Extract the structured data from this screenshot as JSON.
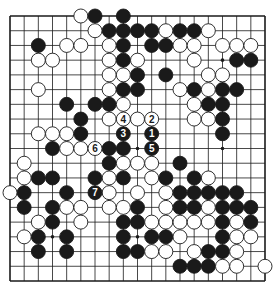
{
  "diagram": {
    "type": "go-board",
    "size": 19,
    "colors": {
      "background": "#ffffff",
      "line": "#1a1a1a",
      "black": "#1a1a1a",
      "white": "#ffffff"
    },
    "star_points": [
      [
        3,
        3
      ],
      [
        3,
        9
      ],
      [
        3,
        15
      ],
      [
        9,
        3
      ],
      [
        9,
        9
      ],
      [
        9,
        15
      ],
      [
        15,
        3
      ],
      [
        15,
        9
      ],
      [
        15,
        15
      ]
    ],
    "black_stones": [
      [
        0,
        6
      ],
      [
        0,
        8
      ],
      [
        1,
        7
      ],
      [
        1,
        8
      ],
      [
        1,
        9
      ],
      [
        1,
        10
      ],
      [
        1,
        12
      ],
      [
        1,
        13
      ],
      [
        2,
        2
      ],
      [
        2,
        8
      ],
      [
        2,
        10
      ],
      [
        2,
        11
      ],
      [
        3,
        8
      ],
      [
        3,
        16
      ],
      [
        3,
        17
      ],
      [
        4,
        9
      ],
      [
        4,
        11
      ],
      [
        5,
        8
      ],
      [
        5,
        9
      ],
      [
        5,
        13
      ],
      [
        5,
        15
      ],
      [
        5,
        16
      ],
      [
        6,
        4
      ],
      [
        6,
        6
      ],
      [
        6,
        7
      ],
      [
        6,
        14
      ],
      [
        6,
        15
      ],
      [
        7,
        5
      ],
      [
        7,
        15
      ],
      [
        8,
        5
      ],
      [
        8,
        15
      ],
      [
        9,
        3
      ],
      [
        9,
        7
      ],
      [
        9,
        8
      ],
      [
        10,
        7
      ],
      [
        10,
        12
      ],
      [
        11,
        2
      ],
      [
        11,
        3
      ],
      [
        11,
        6
      ],
      [
        11,
        8
      ],
      [
        11,
        11
      ],
      [
        11,
        13
      ],
      [
        12,
        1
      ],
      [
        12,
        4
      ],
      [
        12,
        12
      ],
      [
        12,
        13
      ],
      [
        12,
        14
      ],
      [
        12,
        15
      ],
      [
        12,
        16
      ],
      [
        13,
        1
      ],
      [
        13,
        3
      ],
      [
        13,
        9
      ],
      [
        13,
        12
      ],
      [
        13,
        13
      ],
      [
        13,
        15
      ],
      [
        13,
        16
      ],
      [
        13,
        17
      ],
      [
        14,
        3
      ],
      [
        14,
        8
      ],
      [
        14,
        9
      ],
      [
        14,
        15
      ],
      [
        14,
        17
      ],
      [
        15,
        2
      ],
      [
        15,
        4
      ],
      [
        15,
        8
      ],
      [
        15,
        10
      ],
      [
        15,
        11
      ],
      [
        15,
        15
      ],
      [
        16,
        2
      ],
      [
        16,
        4
      ],
      [
        16,
        8
      ],
      [
        16,
        9
      ],
      [
        16,
        14
      ],
      [
        16,
        15
      ],
      [
        17,
        12
      ],
      [
        17,
        13
      ],
      [
        17,
        14
      ]
    ],
    "white_stones": [
      [
        0,
        5
      ],
      [
        1,
        6
      ],
      [
        1,
        11
      ],
      [
        1,
        14
      ],
      [
        2,
        4
      ],
      [
        2,
        5
      ],
      [
        2,
        7
      ],
      [
        2,
        12
      ],
      [
        2,
        13
      ],
      [
        2,
        15
      ],
      [
        2,
        16
      ],
      [
        2,
        17
      ],
      [
        3,
        2
      ],
      [
        3,
        3
      ],
      [
        3,
        7
      ],
      [
        3,
        9
      ],
      [
        3,
        13
      ],
      [
        4,
        7
      ],
      [
        4,
        8
      ],
      [
        4,
        14
      ],
      [
        4,
        15
      ],
      [
        5,
        2
      ],
      [
        5,
        7
      ],
      [
        5,
        12
      ],
      [
        5,
        14
      ],
      [
        6,
        8
      ],
      [
        6,
        13
      ],
      [
        7,
        7
      ],
      [
        7,
        9
      ],
      [
        7,
        13
      ],
      [
        7,
        14
      ],
      [
        8,
        2
      ],
      [
        8,
        3
      ],
      [
        8,
        4
      ],
      [
        9,
        4
      ],
      [
        9,
        5
      ],
      [
        10,
        1
      ],
      [
        10,
        8
      ],
      [
        10,
        9
      ],
      [
        10,
        10
      ],
      [
        11,
        1
      ],
      [
        11,
        7
      ],
      [
        11,
        10
      ],
      [
        11,
        14
      ],
      [
        12,
        0
      ],
      [
        12,
        7
      ],
      [
        12,
        9
      ],
      [
        12,
        11
      ],
      [
        13,
        4
      ],
      [
        13,
        5
      ],
      [
        13,
        7
      ],
      [
        13,
        8
      ],
      [
        13,
        11
      ],
      [
        13,
        14
      ],
      [
        14,
        2
      ],
      [
        14,
        5
      ],
      [
        14,
        10
      ],
      [
        14,
        11
      ],
      [
        14,
        12
      ],
      [
        14,
        13
      ],
      [
        14,
        14
      ],
      [
        14,
        16
      ],
      [
        15,
        1
      ],
      [
        15,
        12
      ],
      [
        15,
        16
      ],
      [
        15,
        17
      ],
      [
        16,
        10
      ],
      [
        16,
        11
      ],
      [
        16,
        13
      ],
      [
        16,
        16
      ],
      [
        17,
        15
      ],
      [
        17,
        16
      ],
      [
        17,
        18
      ]
    ],
    "numbered_moves": [
      {
        "number": "1",
        "color": "black",
        "row": 8,
        "col": 10
      },
      {
        "number": "2",
        "color": "white",
        "row": 7,
        "col": 10
      },
      {
        "number": "3",
        "color": "black",
        "row": 8,
        "col": 8
      },
      {
        "number": "4",
        "color": "white",
        "row": 7,
        "col": 8
      },
      {
        "number": "5",
        "color": "black",
        "row": 9,
        "col": 10
      },
      {
        "number": "6",
        "color": "white",
        "row": 9,
        "col": 6
      },
      {
        "number": "7",
        "color": "black",
        "row": 12,
        "col": 6
      }
    ]
  }
}
